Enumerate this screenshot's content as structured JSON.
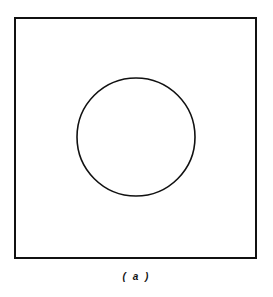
{
  "figure": {
    "caption": "( a )",
    "shapes": {
      "square": {
        "x": 15,
        "y": 18,
        "width": 241,
        "height": 240,
        "stroke": "#111111",
        "stroke_width": 2
      },
      "circle": {
        "cx": 136,
        "cy": 137,
        "r": 59,
        "stroke": "#111111",
        "stroke_width": 1.6
      }
    }
  }
}
